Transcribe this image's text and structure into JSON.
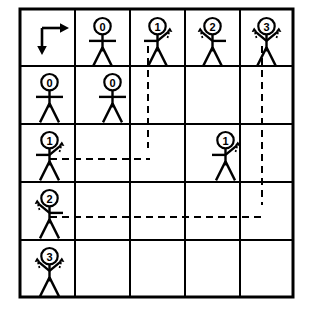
{
  "figure": {
    "kind": "grid-diagram",
    "background_color": "#ffffff",
    "line_color": "#000000",
    "grid": {
      "columns": 5,
      "rows": 5,
      "x_lines": [
        20,
        75,
        130,
        185,
        240,
        293
      ],
      "y_lines": [
        9,
        66,
        124,
        182,
        240,
        297
      ],
      "outer_border_width": 3,
      "inner_line_width": 2
    },
    "origin_cell": {
      "name": "axis-origin",
      "right_arrow_label": "right",
      "down_arrow_label": "down"
    },
    "column_headers": [
      {
        "label": "0",
        "pose": "none"
      },
      {
        "label": "1",
        "pose": "right"
      },
      {
        "label": "2",
        "pose": "left"
      },
      {
        "label": "3",
        "pose": "both"
      }
    ],
    "row_headers": [
      {
        "label": "0",
        "pose": "none"
      },
      {
        "label": "1",
        "pose": "right"
      },
      {
        "label": "2",
        "pose": "left"
      },
      {
        "label": "3",
        "pose": "both"
      }
    ],
    "interior_figures": [
      {
        "label": "0",
        "pose": "none",
        "row": 1,
        "col": 1
      },
      {
        "label": "1",
        "pose": "right",
        "row": 2,
        "col": 3
      }
    ],
    "dashed_connectors": [
      {
        "name": "col1-vertical",
        "orientation": "vertical",
        "x": 148,
        "y1": 46,
        "y2": 148
      },
      {
        "name": "col3-vertical",
        "orientation": "vertical",
        "x": 262,
        "y1": 46,
        "y2": 205
      },
      {
        "name": "row1-horizontal",
        "orientation": "horizontal",
        "y": 159,
        "x1": 50,
        "x2": 150
      },
      {
        "name": "row2-horizontal",
        "orientation": "horizontal",
        "y": 217,
        "x1": 50,
        "x2": 266
      }
    ],
    "dash_pattern": "7 5",
    "dash_width": 2
  }
}
